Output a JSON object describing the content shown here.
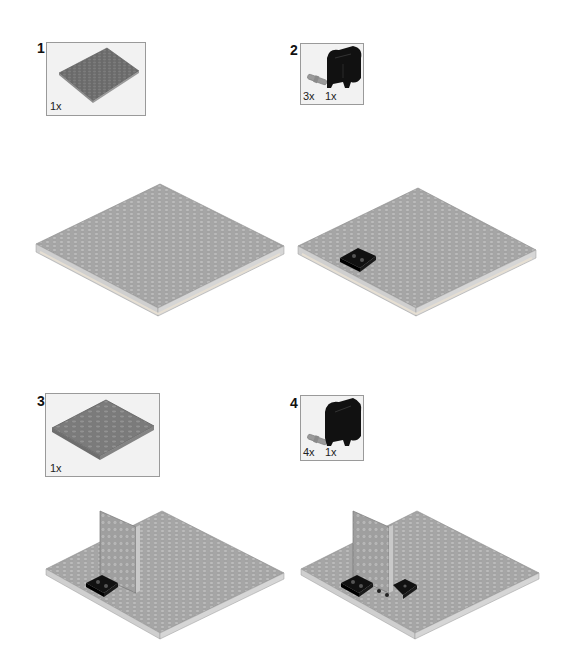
{
  "steps": [
    {
      "number": "1",
      "parts": [
        {
          "name": "baseplate-16x16",
          "qty": "1x",
          "color": "#6e6e6e"
        }
      ]
    },
    {
      "number": "2",
      "parts": [
        {
          "name": "axle-pin",
          "qty": "3x",
          "color": "#9a9a9a"
        },
        {
          "name": "black-brick-2x2-with-pins",
          "qty": "1x",
          "color": "#111111"
        }
      ]
    },
    {
      "number": "3",
      "parts": [
        {
          "name": "plate-6x8",
          "qty": "1x",
          "color": "#7a7a7a"
        }
      ]
    },
    {
      "number": "4",
      "parts": [
        {
          "name": "axle-pin",
          "qty": "4x",
          "color": "#9a9a9a"
        },
        {
          "name": "black-brick-2x2-with-pins",
          "qty": "1x",
          "color": "#111111"
        }
      ]
    }
  ],
  "colors": {
    "plate_top": "#a9a9a9",
    "plate_side": "#cfcfcf",
    "plate_edge": "#e4e0d8",
    "black_part": "#111111",
    "box_bg": "#f2f2f2",
    "box_border": "#9a9a9a"
  }
}
